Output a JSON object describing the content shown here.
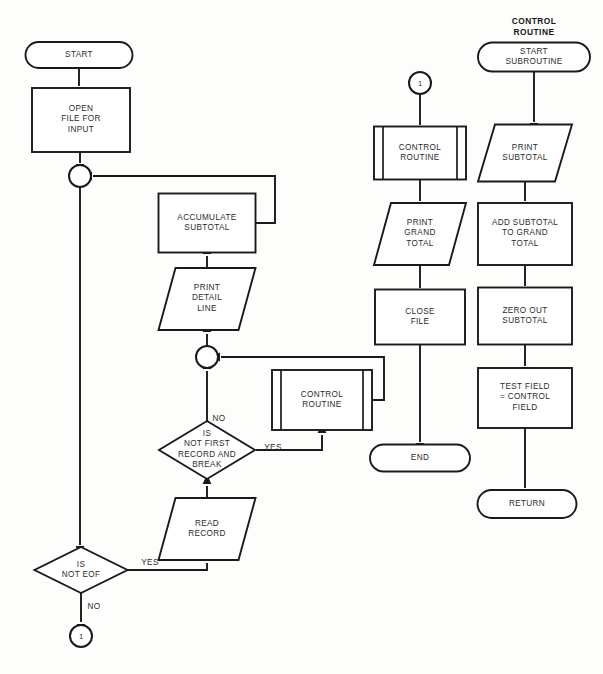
{
  "diagram": {
    "title_headers": [
      {
        "name": "control-routine-header",
        "text": "CONTROL\nROUTINE",
        "x": 534,
        "y": 16
      }
    ],
    "nodes": [
      {
        "id": "start",
        "name": "terminator-start",
        "type": "terminator",
        "label": "START",
        "cx": 79,
        "cy": 55,
        "w": 107,
        "h": 26
      },
      {
        "id": "open_file",
        "name": "process-open-file-for-input",
        "type": "process",
        "label": "OPEN\nFILE FOR\nINPUT",
        "cx": 81,
        "cy": 120,
        "w": 98,
        "h": 64
      },
      {
        "id": "junction_main",
        "name": "connector-junction-main-loop",
        "type": "junction",
        "label": "",
        "cx": 80,
        "cy": 176,
        "w": 22,
        "h": 22
      },
      {
        "id": "accumulate",
        "name": "process-accumulate-subtotal",
        "type": "process",
        "label": "ACCUMULATE\nSUBTOTAL",
        "cx": 207,
        "cy": 223,
        "w": 97,
        "h": 59
      },
      {
        "id": "print_detail",
        "name": "io-print-detail-line",
        "type": "io",
        "label": "PRINT\nDETAIL\nLINE",
        "cx": 207,
        "cy": 299,
        "w": 97,
        "h": 62
      },
      {
        "id": "junction_second",
        "name": "connector-junction-after-break",
        "type": "junction",
        "label": "",
        "cx": 207,
        "cy": 357,
        "w": 22,
        "h": 22
      },
      {
        "id": "decision_break",
        "name": "decision-is-not-first-record-break",
        "type": "decision",
        "label": "IS\nNOT FIRST\nRECORD AND\nBREAK",
        "cx": 207,
        "cy": 450,
        "w": 96,
        "h": 58
      },
      {
        "id": "ctrl_routine_loop",
        "name": "predefined-process-control-routine-loop",
        "type": "predefined",
        "label": "CONTROL\nROUTINE",
        "cx": 322,
        "cy": 400,
        "w": 100,
        "h": 60
      },
      {
        "id": "read_record",
        "name": "io-read-record",
        "type": "io",
        "label": "READ\nRECORD",
        "cx": 207,
        "cy": 529,
        "w": 97,
        "h": 62
      },
      {
        "id": "decision_eof",
        "name": "decision-is-not-eof",
        "type": "decision",
        "label": "IS\nNOT EOF",
        "cx": 81,
        "cy": 570,
        "w": 93,
        "h": 46
      },
      {
        "id": "connector_out",
        "name": "connector-page-exit-1",
        "type": "connector",
        "label": "1",
        "cx": 81,
        "cy": 636,
        "w": 22,
        "h": 22
      },
      {
        "id": "connector_in",
        "name": "connector-page-entry-1",
        "type": "connector",
        "label": "1",
        "cx": 420,
        "cy": 83,
        "w": 22,
        "h": 22
      },
      {
        "id": "ctrl_routine_end",
        "name": "predefined-process-control-routine-end",
        "type": "predefined",
        "label": "CONTROL\nROUTINE",
        "cx": 420,
        "cy": 153,
        "w": 92,
        "h": 53
      },
      {
        "id": "print_grand",
        "name": "io-print-grand-total",
        "type": "io",
        "label": "PRINT\nGRAND\nTOTAL",
        "cx": 420,
        "cy": 234,
        "w": 92,
        "h": 62
      },
      {
        "id": "close_file",
        "name": "process-close-file",
        "type": "process",
        "label": "CLOSE\nFILE",
        "cx": 420,
        "cy": 317,
        "w": 90,
        "h": 55
      },
      {
        "id": "end",
        "name": "terminator-end",
        "type": "terminator",
        "label": "END",
        "cx": 420,
        "cy": 458,
        "w": 100,
        "h": 27
      },
      {
        "id": "start_sub",
        "name": "terminator-start-subroutine",
        "type": "terminator",
        "label": "START\nSUBROUTINE",
        "cx": 534,
        "cy": 57,
        "w": 112,
        "h": 29
      },
      {
        "id": "print_subtotal",
        "name": "io-print-subtotal",
        "type": "io",
        "label": "PRINT\nSUBTOTAL",
        "cx": 525,
        "cy": 153,
        "w": 94,
        "h": 57
      },
      {
        "id": "add_subtotal",
        "name": "process-add-subtotal-to-grand-total",
        "type": "process",
        "label": "ADD SUBTOTAL\nTO GRAND\nTOTAL",
        "cx": 525,
        "cy": 234,
        "w": 94,
        "h": 62
      },
      {
        "id": "zero_subtotal",
        "name": "process-zero-out-subtotal",
        "type": "process",
        "label": "ZERO OUT\nSUBTOTAL",
        "cx": 525,
        "cy": 316,
        "w": 94,
        "h": 57
      },
      {
        "id": "test_field",
        "name": "process-test-field-equals-control",
        "type": "process",
        "label": "TEST FIELD\n= CONTROL\nFIELD",
        "cx": 525,
        "cy": 398,
        "w": 94,
        "h": 60
      },
      {
        "id": "return",
        "name": "terminator-return",
        "type": "terminator",
        "label": "RETURN",
        "cx": 527,
        "cy": 504,
        "w": 99,
        "h": 28
      }
    ],
    "edge_labels": [
      {
        "name": "edge-label-break-no",
        "text": "NO",
        "x": 219,
        "y": 419
      },
      {
        "name": "edge-label-break-yes",
        "text": "YES",
        "x": 273,
        "y": 448
      },
      {
        "name": "edge-label-eof-yes",
        "text": "YES",
        "x": 150,
        "y": 563
      },
      {
        "name": "edge-label-eof-no",
        "text": "NO",
        "x": 94,
        "y": 607
      }
    ],
    "edges": [
      {
        "name": "edge-start-to-open-file",
        "path": "M 79 68 L 79 86",
        "arrow": "down",
        "ax": 79,
        "ay": 88
      },
      {
        "name": "edge-open-file-to-junction",
        "path": "M 80 152 L 80 163",
        "arrow": "down",
        "ax": 80,
        "ay": 165
      },
      {
        "name": "edge-junction-to-eof",
        "path": "M 80 187 L 80 545",
        "arrow": "down",
        "ax": 80,
        "ay": 547
      },
      {
        "name": "edge-accumulate-to-junction",
        "path": "M 256 223 L 275 223 L 275 176 L 93 176",
        "arrow": "left",
        "ax": 91,
        "ay": 176
      },
      {
        "name": "edge-print-detail-to-accumulate",
        "path": "M 207 268 L 207 256",
        "arrow": "up",
        "ax": 207,
        "ay": 253
      },
      {
        "name": "edge-junction2-to-print-detail",
        "path": "M 207 346 L 207 334",
        "arrow": "up",
        "ax": 207,
        "ay": 331
      },
      {
        "name": "edge-decision-no-to-junction2",
        "path": "M 207 422 L 207 371",
        "arrow": "up",
        "ax": 207,
        "ay": 368
      },
      {
        "name": "edge-decision-yes-to-control",
        "path": "M 256 450 L 322 450 L 322 435",
        "arrow": "up",
        "ax": 322,
        "ay": 432
      },
      {
        "name": "edge-control-to-junction2",
        "path": "M 372 400 L 384 400 L 384 357 L 221 357",
        "arrow": "left",
        "ax": 219,
        "ay": 357
      },
      {
        "name": "edge-read-record-to-decision",
        "path": "M 207 498 L 207 486",
        "arrow": "up",
        "ax": 207,
        "ay": 483
      },
      {
        "name": "edge-eof-yes-to-read-record",
        "path": "M 128 570 L 207 570 L 207 563",
        "arrow": "up",
        "ax": 207,
        "ay": 560
      },
      {
        "name": "edge-eof-no-to-connector",
        "path": "M 81 592 L 81 622",
        "arrow": "down",
        "ax": 81,
        "ay": 625
      },
      {
        "name": "edge-connector-to-control-end",
        "path": "M 420 94 L 420 125",
        "arrow": "down",
        "ax": 420,
        "ay": 127
      },
      {
        "name": "edge-control-end-to-print-grand",
        "path": "M 420 180 L 420 201",
        "arrow": "down",
        "ax": 420,
        "ay": 203
      },
      {
        "name": "edge-print-grand-to-close-file",
        "path": "M 420 265 L 420 288",
        "arrow": "down",
        "ax": 420,
        "ay": 290
      },
      {
        "name": "edge-close-file-to-end",
        "path": "M 420 345 L 420 442",
        "arrow": "down",
        "ax": 420,
        "ay": 444
      },
      {
        "name": "edge-start-sub-to-print-sub",
        "path": "M 534 72 L 534 122",
        "arrow": "down",
        "ax": 534,
        "ay": 124
      },
      {
        "name": "edge-print-sub-to-add-sub",
        "path": "M 525 182 L 525 201",
        "arrow": "down",
        "ax": 525,
        "ay": 203
      },
      {
        "name": "edge-add-sub-to-zero-sub",
        "path": "M 525 265 L 525 286",
        "arrow": "down",
        "ax": 525,
        "ay": 288
      },
      {
        "name": "edge-zero-sub-to-test-field",
        "path": "M 525 345 L 525 366",
        "arrow": "down",
        "ax": 525,
        "ay": 368
      },
      {
        "name": "edge-test-field-to-return",
        "path": "M 525 428 L 525 488",
        "arrow": "down",
        "ax": 525,
        "ay": 490
      }
    ],
    "colors": {
      "stroke": "#1a1a1a",
      "fill": "#ffffff",
      "text": "#2b2b2b",
      "background": "#fdfdfc"
    }
  }
}
